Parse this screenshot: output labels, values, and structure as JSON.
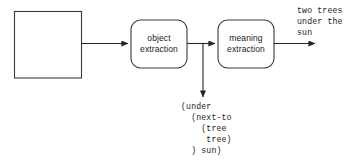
{
  "diagram": {
    "type": "pipeline-flowchart",
    "canvas": {
      "width": 358,
      "height": 163
    },
    "colors": {
      "stroke": "#333333",
      "text": "#1a1a1a",
      "background": "#ffffff",
      "node_fill": "#ffffff"
    },
    "nodes": {
      "input_image": {
        "shape": "rectangle",
        "label": "",
        "description": "empty image placeholder box"
      },
      "object_extraction": {
        "shape": "rounded-rectangle",
        "label": "object\nextraction",
        "line1": "object",
        "line2": "extraction"
      },
      "meaning_extraction": {
        "shape": "rounded-rectangle",
        "label": "meaning\nextraction",
        "line1": "meaning",
        "line2": "extraction"
      }
    },
    "outputs": {
      "sentence": "two trees\nunder the\nsun",
      "sentence_lines": [
        "two trees",
        "under the",
        "sun"
      ],
      "semantic_form": "(under\n  (next-to\n    (tree\n     tree)\n  ) sun)",
      "semantic_form_lines": [
        "(under",
        "   (next-to",
        "      (tree",
        "       tree)",
        "   ) sun)"
      ]
    },
    "edges": [
      {
        "from": "input_image",
        "to": "object_extraction",
        "direction": "right"
      },
      {
        "from": "object_extraction",
        "to": "meaning_extraction",
        "direction": "right"
      },
      {
        "from": "object_extraction",
        "to": "semantic_form",
        "direction": "down"
      },
      {
        "from": "meaning_extraction",
        "to": "sentence",
        "direction": "right"
      }
    ]
  }
}
